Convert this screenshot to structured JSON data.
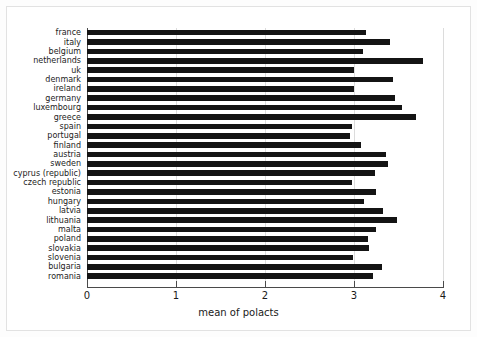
{
  "chart_data": {
    "type": "bar",
    "orientation": "horizontal",
    "title": "",
    "xlabel": "mean of polacts",
    "ylabel": "",
    "xlim": [
      0,
      4
    ],
    "xticks": [
      "0",
      "1",
      "2",
      "3",
      "4"
    ],
    "xtick_values": [
      0,
      1,
      2,
      3,
      4
    ],
    "grid": "vertical",
    "legend": "none",
    "bar_color": "#141414",
    "categories": [
      "france",
      "italy",
      "belgium",
      "netherlands",
      "uk",
      "denmark",
      "ireland",
      "germany",
      "luxembourg",
      "greece",
      "spain",
      "portugal",
      "finland",
      "austria",
      "sweden",
      "cyprus (republic)",
      "czech republic",
      "estonia",
      "hungary",
      "latvia",
      "lithuania",
      "malta",
      "poland",
      "slovakia",
      "slovenia",
      "bulgaria",
      "romania"
    ],
    "values": [
      3.14,
      3.4,
      3.1,
      3.78,
      3.0,
      3.44,
      3.0,
      3.46,
      3.54,
      3.7,
      2.98,
      2.96,
      3.08,
      3.36,
      3.38,
      3.24,
      2.98,
      3.25,
      3.11,
      3.33,
      3.48,
      3.25,
      3.16,
      3.17,
      2.99,
      3.32,
      3.21
    ]
  }
}
